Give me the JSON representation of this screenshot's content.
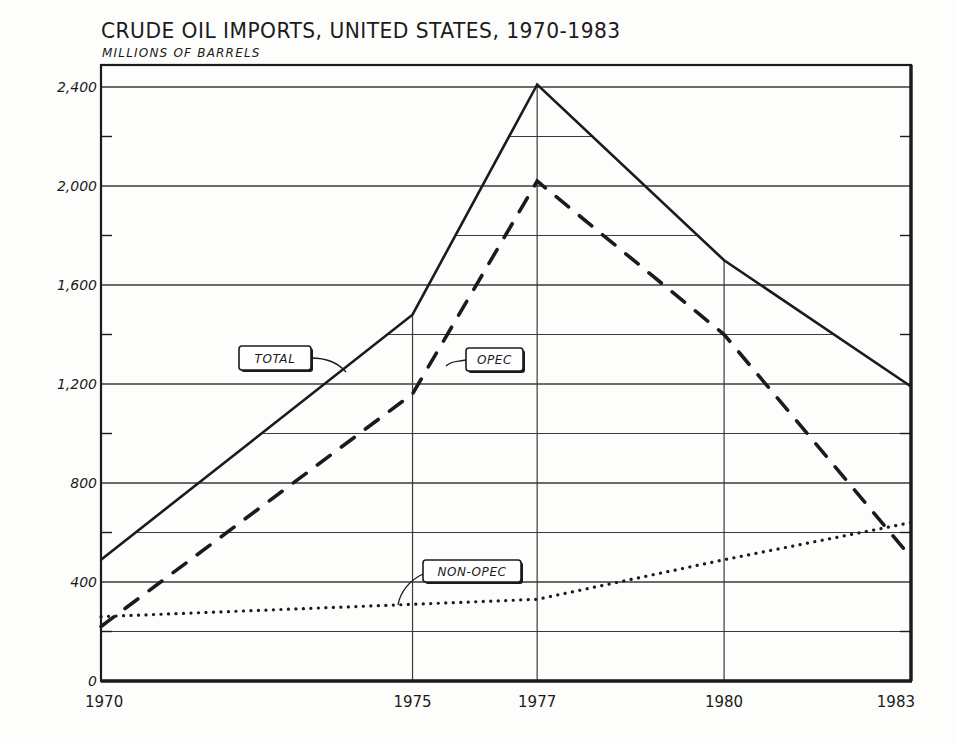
{
  "header": {
    "title": "CRUDE OIL  IMPORTS, UNITED STATES, 1970-1983",
    "subtitle": "MILLIONS  OF  BARRELS"
  },
  "colors": {
    "ink": "#1b1b1b",
    "grid": "#3a3a3a",
    "background": "#fdfdfc"
  },
  "chart_data": {
    "type": "line",
    "title": "CRUDE OIL IMPORTS, UNITED STATES, 1970-1983",
    "subtitle": "MILLIONS OF BARRELS",
    "xlabel": "",
    "ylabel": "Millions of barrels",
    "x": [
      1970,
      1975,
      1977,
      1980,
      1983
    ],
    "x_tick_labels": [
      "1970",
      "1975",
      "1977",
      "1980",
      "1983"
    ],
    "y_ticks": [
      0,
      400,
      800,
      1200,
      1600,
      2000,
      2400
    ],
    "y_tick_labels": [
      "0",
      "400",
      "800",
      "1,200",
      "1,600",
      "2,000",
      "2,400"
    ],
    "ylim": [
      0,
      2490
    ],
    "grid": true,
    "legend_position": "inline labels",
    "series": [
      {
        "name": "TOTAL",
        "style": "solid",
        "values": [
          490,
          1480,
          2410,
          1700,
          1190
        ]
      },
      {
        "name": "OPEC",
        "style": "dashed",
        "values": [
          220,
          1160,
          2020,
          1400,
          500
        ]
      },
      {
        "name": "NON-OPEC",
        "style": "dotted",
        "values": [
          260,
          310,
          330,
          490,
          640
        ]
      }
    ],
    "annotations": [
      {
        "text": "TOTAL",
        "points_to": "TOTAL"
      },
      {
        "text": "OPEC",
        "points_to": "OPEC"
      },
      {
        "text": "NON-OPEC",
        "points_to": "NON-OPEC"
      }
    ]
  }
}
